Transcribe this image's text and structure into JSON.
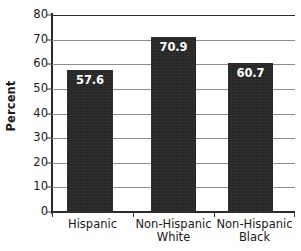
{
  "chart_data": {
    "type": "bar",
    "title": "",
    "subtitle": "",
    "xlabel": "",
    "ylabel": "Percent",
    "ylim": [
      0,
      80
    ],
    "ytick_interval": 10,
    "yticks": [
      "80",
      "70",
      "60",
      "50",
      "40",
      "30",
      "20",
      "10",
      "0"
    ],
    "ytick_values": [
      80,
      70,
      60,
      50,
      40,
      30,
      20,
      10,
      0
    ],
    "grid": true,
    "grid_axis": "y",
    "legend": false,
    "legend_position": "none",
    "categories": [
      "Hispanic",
      "Non-Hispanic White",
      "Non-Hispanic Black"
    ],
    "category_lines": [
      [
        "Hispanic"
      ],
      [
        "Non-Hispanic",
        "White"
      ],
      [
        "Non-Hispanic",
        "Black"
      ]
    ],
    "values": [
      57.6,
      70.9,
      60.7
    ],
    "value_labels": [
      "57.6",
      "70.9",
      "60.7"
    ],
    "bar_color": "#262626",
    "value_label_color": "#ffffff",
    "gridline_color": "#8d8d8d",
    "axis_color": "#2a2a2a",
    "background_color": "#ffffff"
  }
}
